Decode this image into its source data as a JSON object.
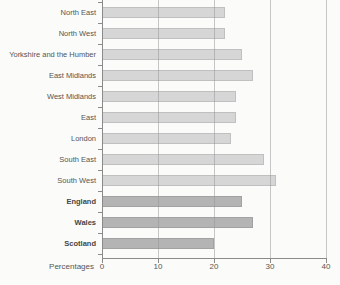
{
  "chart_data": {
    "type": "bar",
    "orientation": "horizontal",
    "title": "",
    "xlabel": "Percentages",
    "xlim": [
      0,
      40
    ],
    "xticks": [
      0,
      10,
      20,
      30,
      40
    ],
    "grid": "vertical gridlines at each x tick, drawn across bars",
    "legend": "none",
    "categories": [
      "North East",
      "North West",
      "Yorkshire and the Humber",
      "East Midlands",
      "West Midlands",
      "East",
      "London",
      "South East",
      "South West",
      "England",
      "Wales",
      "Scotland"
    ],
    "values": [
      22,
      22,
      25,
      27,
      24,
      24,
      23,
      29,
      31,
      25,
      27,
      20
    ],
    "bars": [
      {
        "label": "North East",
        "value": 22,
        "group": "region"
      },
      {
        "label": "North West",
        "value": 22,
        "group": "region"
      },
      {
        "label": "Yorkshire and the Humber",
        "value": 25,
        "group": "region"
      },
      {
        "label": "East Midlands",
        "value": 27,
        "group": "region"
      },
      {
        "label": "West Midlands",
        "value": 24,
        "group": "region"
      },
      {
        "label": "East",
        "value": 24,
        "group": "region"
      },
      {
        "label": "London",
        "value": 23,
        "group": "region"
      },
      {
        "label": "South East",
        "value": 29,
        "group": "region"
      },
      {
        "label": "South West",
        "value": 31,
        "group": "region"
      },
      {
        "label": "England",
        "value": 25,
        "group": "country"
      },
      {
        "label": "Wales",
        "value": 27,
        "group": "country"
      },
      {
        "label": "Scotland",
        "value": 20,
        "group": "country"
      }
    ],
    "groups": {
      "region": {
        "bar_color": "#d6d6d6",
        "label_weight": "normal"
      },
      "country": {
        "bar_color": "#b4b4b4",
        "label_weight": "bold"
      }
    }
  },
  "colors": {
    "background": "#fbfbfa",
    "bar_light": "#d6d6d6",
    "bar_dark": "#b4b4b4",
    "axis": "#8a8a8a",
    "gridline": "#919191",
    "text": "#555555"
  }
}
